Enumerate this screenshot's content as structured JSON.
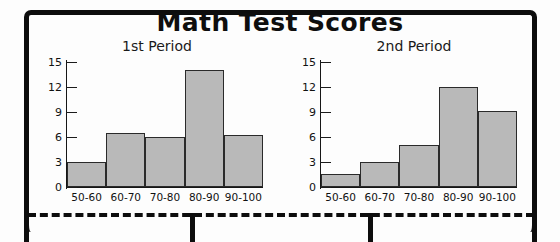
{
  "worksheet": {
    "title": "Math Test Scores"
  },
  "chart_data": [
    {
      "type": "bar",
      "title": "1st Period",
      "categories": [
        "50-60",
        "60-70",
        "70-80",
        "80-90",
        "90-100"
      ],
      "values": [
        3,
        6.5,
        6,
        14,
        6.2
      ],
      "xlabel": "",
      "ylabel": "",
      "ylim": [
        0,
        15
      ],
      "yticks": [
        0,
        3,
        6,
        9,
        12,
        15
      ],
      "ytick_labels": [
        "0",
        "3",
        "6",
        "9",
        "12",
        "15"
      ],
      "grid": false,
      "legend": "none",
      "bar_fill": "#b9b9b9",
      "bar_edge": "#2a2a2a"
    },
    {
      "type": "bar",
      "title": "2nd Period",
      "categories": [
        "50-60",
        "60-70",
        "70-80",
        "80-90",
        "90-100"
      ],
      "values": [
        1.6,
        3,
        5,
        12,
        9.1
      ],
      "xlabel": "",
      "ylabel": "",
      "ylim": [
        0,
        15
      ],
      "yticks": [
        0,
        3,
        6,
        9,
        12,
        15
      ],
      "ytick_labels": [
        "0",
        "3",
        "6",
        "9",
        "12",
        "15"
      ],
      "grid": false,
      "legend": "none",
      "bar_fill": "#b9b9b9",
      "bar_edge": "#2a2a2a"
    }
  ]
}
